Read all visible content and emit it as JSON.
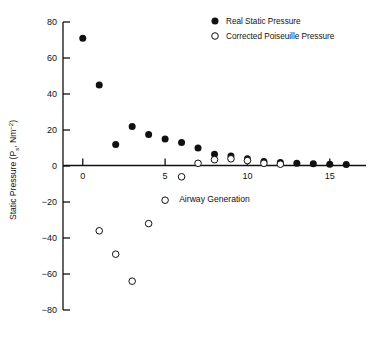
{
  "chart_data": {
    "type": "scatter",
    "title": "",
    "xlabel": "Airway Generation",
    "ylabel": "Static Pressure (P, Nm−2)",
    "ylabel_main": "Static Pressure (P",
    "ylabel_sub": "s",
    "ylabel_unit": ", Nm",
    "ylabel_exp": "−2",
    "ylabel_close": ")",
    "xlim": [
      -1.2,
      17.2
    ],
    "ylim": [
      -80,
      80
    ],
    "xticks": [
      0,
      5,
      10,
      15
    ],
    "yticks": [
      80,
      60,
      40,
      20,
      0,
      -20,
      -40,
      -60,
      -80
    ],
    "xtick_labels": [
      "0",
      "5",
      "10",
      "15"
    ],
    "ytick_labels": [
      "80",
      "60",
      "40",
      "20",
      "0",
      "−20",
      "−40",
      "−60",
      "−80"
    ],
    "grid": false,
    "legend_position": "top-right",
    "series": [
      {
        "name": "Real Static Pressure",
        "marker": "filled-circle",
        "color": "#111111",
        "x": [
          0,
          1,
          2,
          3,
          4,
          5,
          6,
          7,
          8,
          9,
          10,
          11,
          12,
          13,
          14,
          15,
          16
        ],
        "y": [
          71,
          45,
          12,
          22,
          17.5,
          15,
          13,
          10,
          6.5,
          5.5,
          4,
          2.5,
          2,
          1.5,
          1.2,
          1,
          0.8
        ]
      },
      {
        "name": "Corrected Poiseuille Pressure",
        "marker": "open-circle",
        "color": "#111111",
        "x": [
          1,
          2,
          3,
          4,
          5,
          6,
          7,
          8,
          9,
          10,
          11,
          12
        ],
        "y": [
          -36,
          -49,
          -64,
          -32,
          -19,
          -6,
          1.5,
          3.5,
          4,
          3,
          1.5,
          1
        ]
      }
    ]
  },
  "legend": {
    "items": [
      {
        "label": "Real Static Pressure",
        "marker": "filled-circle"
      },
      {
        "label": "Corrected Poiseuille Pressure",
        "marker": "open-circle"
      }
    ]
  },
  "caption": {
    "text": ""
  }
}
